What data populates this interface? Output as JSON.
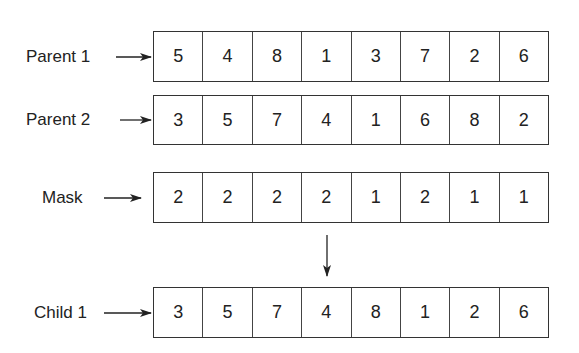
{
  "rows": [
    {
      "id": "parent1",
      "label": "Parent 1",
      "values": [
        5,
        4,
        8,
        1,
        3,
        7,
        2,
        6
      ]
    },
    {
      "id": "parent2",
      "label": "Parent 2",
      "values": [
        3,
        5,
        7,
        4,
        1,
        6,
        8,
        2
      ]
    },
    {
      "id": "mask",
      "label": "Mask",
      "values": [
        2,
        2,
        2,
        2,
        1,
        2,
        1,
        1
      ]
    },
    {
      "id": "child1",
      "label": "Child 1",
      "values": [
        3,
        5,
        7,
        4,
        8,
        1,
        2,
        6
      ]
    }
  ],
  "colors": {
    "stroke": "#333333",
    "text": "#222222",
    "background": "#ffffff"
  }
}
